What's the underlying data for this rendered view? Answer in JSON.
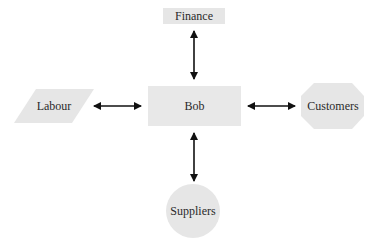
{
  "diagram": {
    "center": {
      "label": "Bob"
    },
    "nodes": [
      {
        "id": "finance",
        "label": "Finance",
        "shape": "rectangle",
        "position": "top"
      },
      {
        "id": "labour",
        "label": "Labour",
        "shape": "parallelogram",
        "position": "left"
      },
      {
        "id": "customers",
        "label": "Customers",
        "shape": "octagon",
        "position": "right"
      },
      {
        "id": "suppliers",
        "label": "Suppliers",
        "shape": "circle",
        "position": "bottom"
      }
    ],
    "edges": [
      {
        "from": "Bob",
        "to": "Finance",
        "type": "bidirectional"
      },
      {
        "from": "Bob",
        "to": "Labour",
        "type": "bidirectional"
      },
      {
        "from": "Bob",
        "to": "Customers",
        "type": "bidirectional"
      },
      {
        "from": "Bob",
        "to": "Suppliers",
        "type": "bidirectional"
      }
    ],
    "colors": {
      "shape_fill": "#e6e6e6",
      "arrow": "#111111",
      "text": "#2a2a2a"
    }
  }
}
